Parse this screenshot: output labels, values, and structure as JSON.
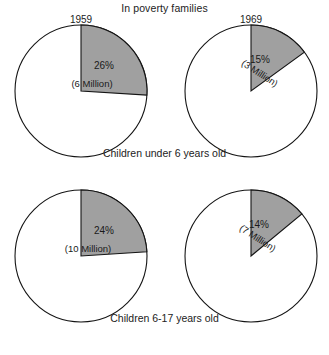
{
  "title": "In poverty families",
  "columns": [
    {
      "year": "1959"
    },
    {
      "year": "1969"
    }
  ],
  "rows": [
    {
      "caption": "Children under 6 years old"
    },
    {
      "caption": "Children 6-17 years old"
    }
  ],
  "colors": {
    "wedge_fill": "#a0a0a0",
    "wedge_stroke": "#141414",
    "background": "#ffffff",
    "text": "#1a1a1a"
  },
  "pies": [
    {
      "id": "pie-1959-under6",
      "year": "1959",
      "group": "Children under 6 years old",
      "percent_label": "26%",
      "value_label": "(6 Million)",
      "percent": 26,
      "millions": 6,
      "cx": 81,
      "cy": 91,
      "r": 66,
      "start_angle": 0,
      "sweep": 93.6,
      "pct_x": 104,
      "pct_y": 69,
      "val_x": 92,
      "val_y": 87,
      "val_rotate": 0
    },
    {
      "id": "pie-1969-under6",
      "year": "1969",
      "group": "Children under 6 years old",
      "percent_label": "15%",
      "value_label": "(3 Million)",
      "percent": 15,
      "millions": 3,
      "cx": 251,
      "cy": 91,
      "r": 66,
      "start_angle": 0,
      "sweep": 54,
      "pct_x": 260,
      "pct_y": 63,
      "val_x": 258,
      "val_y": 76,
      "val_rotate": 33
    },
    {
      "id": "pie-1959-6to17",
      "year": "1959",
      "group": "Children 6-17 years old",
      "percent_label": "24%",
      "value_label": "(10 Million)",
      "percent": 24,
      "millions": 10,
      "cx": 81,
      "cy": 256,
      "r": 66,
      "start_angle": 0,
      "sweep": 86.4,
      "pct_x": 104,
      "pct_y": 234,
      "val_x": 88,
      "val_y": 252,
      "val_rotate": 0
    },
    {
      "id": "pie-1969-6to17",
      "year": "1969",
      "group": "Children 6-17 years old",
      "percent_label": "14%",
      "value_label": "(7 Million)",
      "percent": 14,
      "millions": 7,
      "cx": 251,
      "cy": 256,
      "r": 66,
      "start_angle": 0,
      "sweep": 50.4,
      "pct_x": 259,
      "pct_y": 228,
      "val_x": 256,
      "val_y": 241,
      "val_rotate": 33
    }
  ],
  "chart_data": {
    "type": "pie",
    "title": "In poverty families",
    "xlabel": "",
    "ylabel": "",
    "legend": "none",
    "grid": false,
    "note": "Four pie charts in a 2x2 grid; shaded sector = share of children in poverty families. Each wedge begins at 12 o'clock and sweeps clockwise.",
    "panels": [
      {
        "row": "Children under 6 years old",
        "column": "1959",
        "slices": [
          {
            "label": "In poverty",
            "percent": 26,
            "value_millions": 6,
            "shaded": true
          },
          {
            "label": "Not in poverty",
            "percent": 74,
            "value_millions": null,
            "shaded": false
          }
        ]
      },
      {
        "row": "Children under 6 years old",
        "column": "1969",
        "slices": [
          {
            "label": "In poverty",
            "percent": 15,
            "value_millions": 3,
            "shaded": true
          },
          {
            "label": "Not in poverty",
            "percent": 85,
            "value_millions": null,
            "shaded": false
          }
        ]
      },
      {
        "row": "Children 6-17 years old",
        "column": "1959",
        "slices": [
          {
            "label": "In poverty",
            "percent": 24,
            "value_millions": 10,
            "shaded": true
          },
          {
            "label": "Not in poverty",
            "percent": 76,
            "value_millions": null,
            "shaded": false
          }
        ]
      },
      {
        "row": "Children 6-17 years old",
        "column": "1969",
        "slices": [
          {
            "label": "In poverty",
            "percent": 14,
            "value_millions": 7,
            "shaded": true
          },
          {
            "label": "Not in poverty",
            "percent": 86,
            "value_millions": null,
            "shaded": false
          }
        ]
      }
    ]
  }
}
